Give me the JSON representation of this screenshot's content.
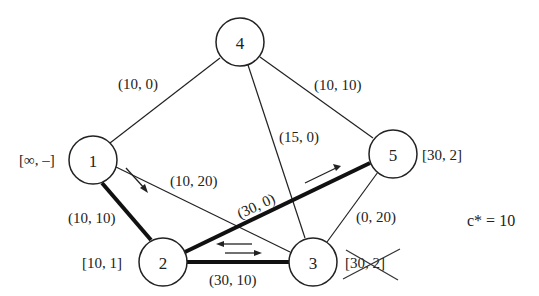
{
  "diagram": {
    "type": "flow-network",
    "nodes": [
      {
        "id": "1",
        "label": "1",
        "mark": "[∞, –]",
        "cx": 93,
        "cy": 160
      },
      {
        "id": "2",
        "label": "2",
        "mark": "[10, 1]",
        "cx": 163,
        "cy": 262
      },
      {
        "id": "3",
        "label": "3",
        "mark": "[30, 2]",
        "mark_crossed_out": true,
        "cx": 313,
        "cy": 262
      },
      {
        "id": "4",
        "label": "4",
        "mark": "",
        "cx": 240,
        "cy": 42
      },
      {
        "id": "5",
        "label": "5",
        "mark": "[30, 2]",
        "cx": 393,
        "cy": 154
      }
    ],
    "edges": [
      {
        "from": "1",
        "to": "4",
        "label": "(10, 0)",
        "bold": false
      },
      {
        "from": "4",
        "to": "5",
        "label": "(10, 10)",
        "bold": false
      },
      {
        "from": "4",
        "to": "3",
        "label": "(15, 0)",
        "bold": false
      },
      {
        "from": "1",
        "to": "3",
        "label": "(10, 20)",
        "bold": false
      },
      {
        "from": "1",
        "to": "2",
        "label": "(10, 10)",
        "bold": true,
        "arrow": "1→2"
      },
      {
        "from": "2",
        "to": "5",
        "label": "(30, 0)",
        "bold": true,
        "arrow": "2→5"
      },
      {
        "from": "2",
        "to": "3",
        "label": "(30, 10)",
        "bold": true,
        "arrow": "bidirectional"
      },
      {
        "from": "3",
        "to": "5",
        "label": "(0, 20)",
        "bold": false
      }
    ],
    "annotation": {
      "text": "c* = 10",
      "var": "c*",
      "value": "10"
    }
  },
  "labels": {
    "node1": "1",
    "node2": "2",
    "node3": "3",
    "node4": "4",
    "node5": "5",
    "mark1": "[∞, –]",
    "mark2": "[10, 1]",
    "mark3": "[30, 2]",
    "mark5": "[30, 2]",
    "e14": "(10, 0)",
    "e45": "(10, 10)",
    "e43": "(15, 0)",
    "e13": "(10, 20)",
    "e12": "(10, 10)",
    "e25": "(30, 0)",
    "e23": "(30, 10)",
    "e35": "(0, 20)",
    "cstar": "c* = 10"
  }
}
